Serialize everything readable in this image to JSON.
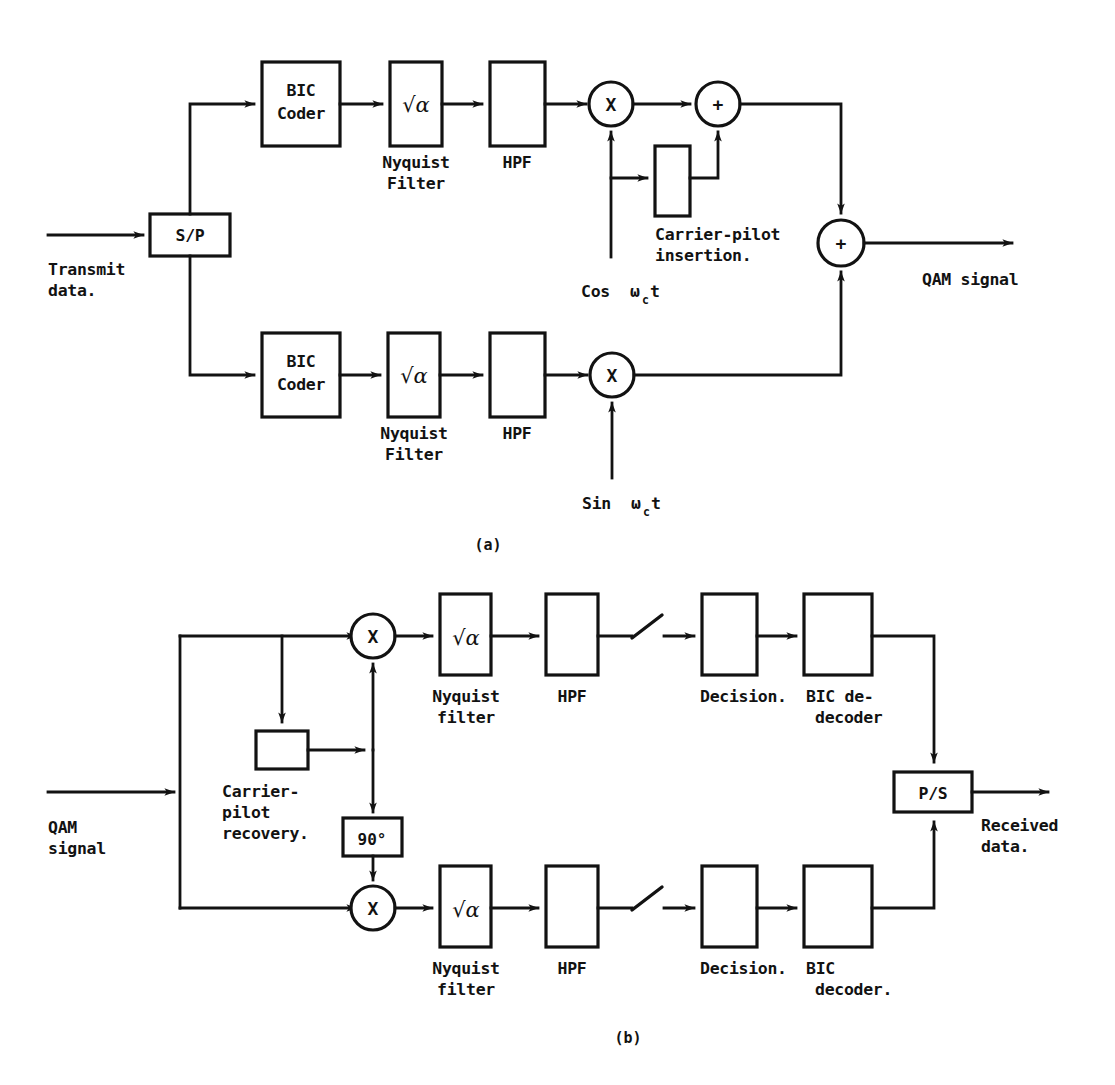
{
  "figure": {
    "title_hidden": "",
    "captions": {
      "a": "(a)",
      "b": "(b)"
    }
  },
  "transmitter": {
    "id": "a",
    "input_label_line1": "Transmit",
    "input_label_line2": "data.",
    "output_label": "QAM signal",
    "splitter": "S/P",
    "upper_branch": {
      "coder_line1": "BIC",
      "coder_line2": "Coder",
      "nyquist_symbol": "√α",
      "nyquist_label_line1": "Nyquist",
      "nyquist_label_line2": "Filter",
      "hpf_label": "HPF",
      "mixer_symbol": "X",
      "adder_symbol": "+",
      "carrier_label_pre": "Cos",
      "carrier_label_sub": "c",
      "carrier_label_post": "t",
      "carrier_omega": "ω",
      "pilot_label_line1": "Carrier-pilot",
      "pilot_label_line2": "insertion."
    },
    "lower_branch": {
      "coder_line1": "BIC",
      "coder_line2": "Coder",
      "nyquist_symbol": "√α",
      "nyquist_label_line1": "Nyquist",
      "nyquist_label_line2": "Filter",
      "hpf_label": "HPF",
      "mixer_symbol": "X",
      "carrier_label_pre": "Sin",
      "carrier_label_sub": "c",
      "carrier_label_post": "t",
      "carrier_omega": "ω"
    },
    "final_adder_symbol": "+"
  },
  "receiver": {
    "id": "b",
    "input_label_line1": "QAM",
    "input_label_line2": "signal",
    "output_label_line1": "Received",
    "output_label_line2": "data.",
    "combiner": "P/S",
    "recovery": {
      "label_line1": "Carrier-",
      "label_line2": "pilot",
      "label_line3": "recovery.",
      "phase_shifter": "90°"
    },
    "upper_branch": {
      "mixer_symbol": "X",
      "nyquist_symbol": "√α",
      "nyquist_label_line1": "Nyquist",
      "nyquist_label_line2": "filter",
      "hpf_label": "HPF",
      "decision_label": "Decision.",
      "decoder_label_line1": "BIC de-",
      "decoder_label_line2": "decoder"
    },
    "lower_branch": {
      "mixer_symbol": "X",
      "nyquist_symbol": "√α",
      "nyquist_label_line1": "Nyquist",
      "nyquist_label_line2": "filter",
      "hpf_label": "HPF",
      "decision_label": "Decision.",
      "decoder_label_line1": "BIC",
      "decoder_label_line2": "decoder."
    }
  },
  "colors": {
    "ink": "#121212",
    "paper": "#ffffff"
  }
}
